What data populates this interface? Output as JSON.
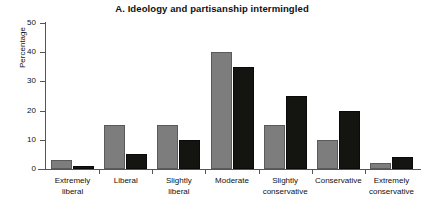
{
  "chart_data": {
    "type": "bar",
    "title": "A. Ideology and partisanship intermingled",
    "xlabel": "",
    "ylabel": "Percentage",
    "ylim": [
      0,
      50
    ],
    "yticks": [
      0,
      10,
      20,
      30,
      40,
      50
    ],
    "grid": false,
    "legend": "none",
    "categories": [
      "Extremely liberal",
      "Liberal",
      "Slightly liberal",
      "Moderate",
      "Slightly conservative",
      "Conservative",
      "Extremely conservative"
    ],
    "category_lines": [
      [
        "Extremely",
        "liberal"
      ],
      [
        "Liberal",
        ""
      ],
      [
        "Slightly",
        "liberal"
      ],
      [
        "Moderate",
        ""
      ],
      [
        "Slightly",
        "conservative"
      ],
      [
        "Conservative",
        ""
      ],
      [
        "Extremely",
        "conservative"
      ]
    ],
    "series": [
      {
        "name": "series-gray",
        "color": "#7d7d7d",
        "values": [
          3,
          15,
          15,
          40,
          15,
          10,
          2
        ]
      },
      {
        "name": "series-dark",
        "color": "#141410",
        "values": [
          1,
          5,
          10,
          35,
          25,
          20,
          4
        ]
      }
    ]
  },
  "colors": {
    "gray_bar": "#7d7d7d",
    "dark_bar": "#141410",
    "axis": "#555555",
    "text": "#111111",
    "background": "#ffffff"
  }
}
